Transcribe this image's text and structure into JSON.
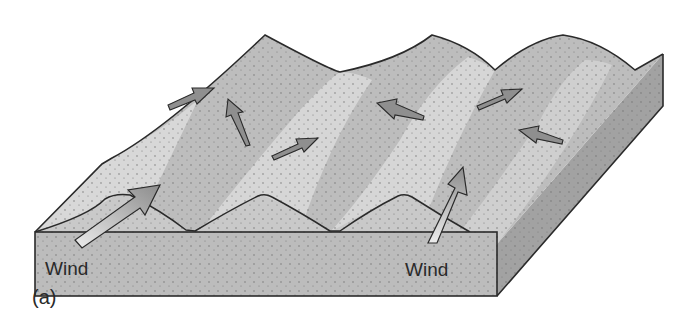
{
  "figure": {
    "panel_label": "(a)",
    "labels": [
      {
        "text": "Wind",
        "position": "front-left"
      },
      {
        "text": "Wind",
        "position": "front-right"
      }
    ],
    "arrows": [
      {
        "kind": "large-wind",
        "position": "front-left",
        "direction": "up-right"
      },
      {
        "kind": "large-wind",
        "position": "front-right",
        "direction": "up"
      },
      {
        "kind": "small-flow",
        "position": "top-left-ridge",
        "direction": "right"
      },
      {
        "kind": "small-flow",
        "position": "left-slip-face",
        "direction": "up"
      },
      {
        "kind": "small-flow",
        "position": "mid-trough",
        "direction": "right"
      },
      {
        "kind": "small-flow",
        "position": "mid-slope",
        "direction": "left"
      },
      {
        "kind": "small-flow",
        "position": "right-trough",
        "direction": "right"
      },
      {
        "kind": "small-flow",
        "position": "right-slope",
        "direction": "left"
      }
    ],
    "colors": {
      "block_front": "#b9b9b9",
      "block_side": "#9e9e9e",
      "dune_dark": "#b4b4b4",
      "dune_light": "#d6d6d6",
      "outline": "#2a2a2a",
      "arrow_dark": "#8a8a8a",
      "arrow_light": "#e6e6e6"
    }
  }
}
